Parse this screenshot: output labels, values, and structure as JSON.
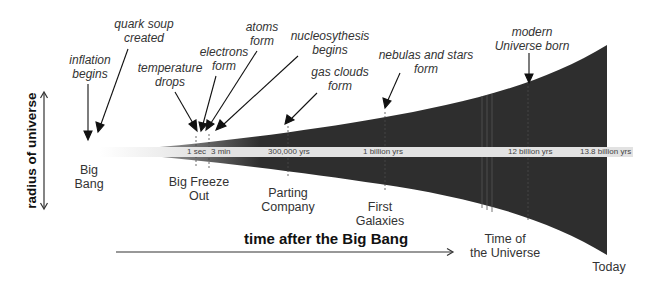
{
  "diagram": {
    "x_axis_label": "time after the Big Bang",
    "y_axis_label": "radius of universe",
    "colors": {
      "universe_fill": "#2e2e2e",
      "timeline_band": "#e2e2e2",
      "text": "#333333",
      "background": "#ffffff"
    },
    "events": [
      {
        "label_line1": "inflation",
        "label_line2": "begins"
      },
      {
        "label_line1": "quark soup",
        "label_line2": "created"
      },
      {
        "label_line1": "temperature",
        "label_line2": "drops"
      },
      {
        "label_line1": "electrons",
        "label_line2": "form"
      },
      {
        "label_line1": "atoms",
        "label_line2": "form"
      },
      {
        "label_line1": "nucleosythesis",
        "label_line2": "begins"
      },
      {
        "label_line1": "gas clouds",
        "label_line2": "form"
      },
      {
        "label_line1": "nebulas and stars",
        "label_line2": "form"
      },
      {
        "label_line1": "modern",
        "label_line2": "Universe born"
      }
    ],
    "eras": [
      {
        "label_line1": "Big",
        "label_line2": "Bang"
      },
      {
        "label_line1": "Big Freeze",
        "label_line2": "Out"
      },
      {
        "label_line1": "Parting",
        "label_line2": "Company"
      },
      {
        "label_line1": "First",
        "label_line2": "Galaxies"
      },
      {
        "label_line1": "Time of",
        "label_line2": "the Universe"
      },
      {
        "label_line1": "Today",
        "label_line2": ""
      }
    ],
    "timeline_ticks": [
      "1 sec",
      "3 min",
      "300,000 yrs",
      "1 billion yrs",
      "12 billion yrs",
      "13.8 billion yrs"
    ],
    "icons": {
      "y_axis_arrow": "double-headed-vertical-arrow",
      "x_axis_arrow": "right-arrow",
      "event_pointer": "down-arrow"
    }
  }
}
